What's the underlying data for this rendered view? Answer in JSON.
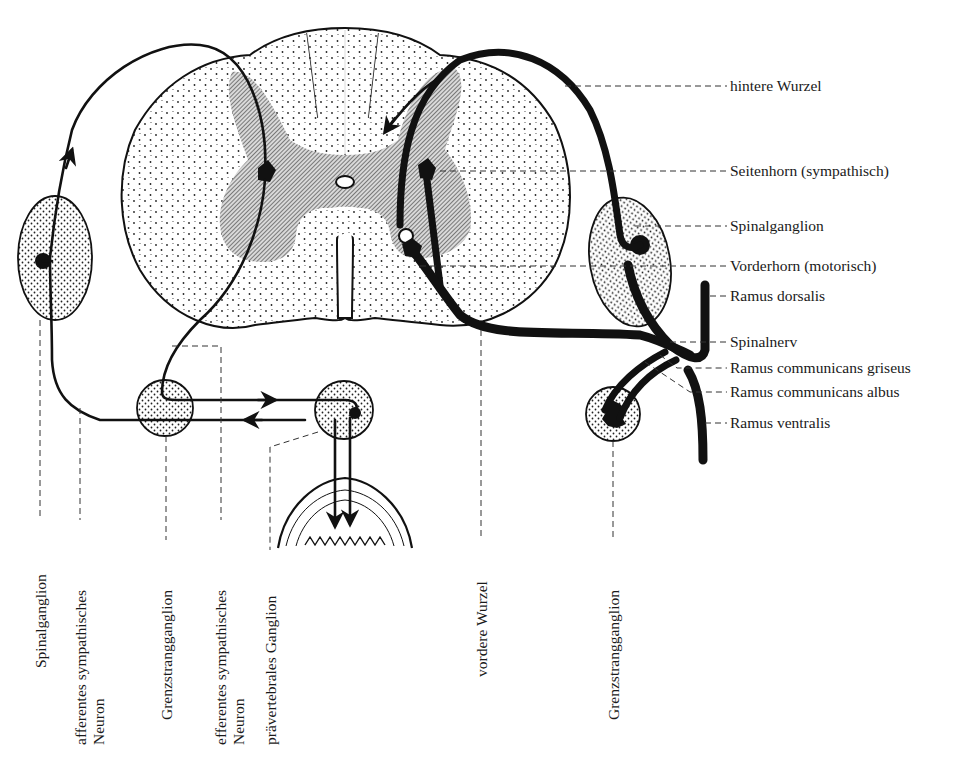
{
  "figure": {
    "language": "de"
  },
  "colors": {
    "ink": "#111111",
    "paper": "#ffffff",
    "grey_matter_hatch": "#555555",
    "leader_line": "#333333"
  },
  "labels_right": [
    {
      "id": "hintere-wurzel",
      "text": "hintere Wurzel"
    },
    {
      "id": "seitenhorn",
      "text": "Seitenhorn (sympathisch)"
    },
    {
      "id": "spinalganglion-right",
      "text": "Spinalganglion"
    },
    {
      "id": "vorderhorn",
      "text": "Vorderhorn (motorisch)"
    },
    {
      "id": "ramus-dorsalis",
      "text": "Ramus dorsalis"
    },
    {
      "id": "spinalnerv",
      "text": "Spinalnerv"
    },
    {
      "id": "ramus-communicans-griseus",
      "text": "Ramus communicans griseus"
    },
    {
      "id": "ramus-communicans-albus",
      "text": "Ramus communicans albus"
    },
    {
      "id": "ramus-ventralis",
      "text": "Ramus ventralis"
    }
  ],
  "labels_bottom": [
    {
      "id": "spinalganglion-left",
      "lines": [
        "Spinalganglion"
      ]
    },
    {
      "id": "afferentes-neuron",
      "lines": [
        "afferentes sympathisches",
        "Neuron"
      ]
    },
    {
      "id": "grenzstrangganglion-left",
      "lines": [
        "Grenzstrangganglion"
      ]
    },
    {
      "id": "efferentes-neuron",
      "lines": [
        "efferentes sympathisches",
        "Neuron"
      ]
    },
    {
      "id": "praevertebrales-ganglion",
      "lines": [
        "prävertebrales Ganglion"
      ]
    },
    {
      "id": "vordere-wurzel",
      "lines": [
        "vordere Wurzel"
      ]
    },
    {
      "id": "grenzstrangganglion-right",
      "lines": [
        "Grenzstrangganglion"
      ]
    }
  ],
  "structures": [
    {
      "name": "spinal-cord-cross-section",
      "components": [
        "white matter (stippled)",
        "grey matter (hatched)",
        "central canal",
        "anterior median fissure",
        "posterior median septum"
      ]
    },
    {
      "name": "spinal-ganglion-left"
    },
    {
      "name": "spinal-ganglion-right"
    },
    {
      "name": "sympathetic-trunk-ganglion-left"
    },
    {
      "name": "sympathetic-trunk-ganglion-right"
    },
    {
      "name": "prevertebral-ganglion"
    },
    {
      "name": "target-organ-intestinal-wall"
    }
  ]
}
